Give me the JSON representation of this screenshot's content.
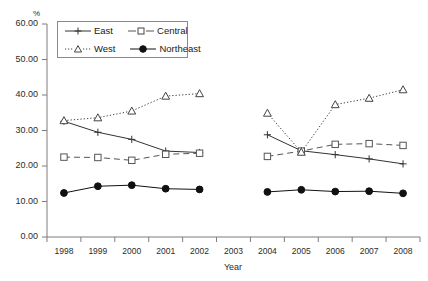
{
  "chart_data": {
    "type": "line",
    "title": "",
    "subtitle": "",
    "xlabel": "Year",
    "ylabel": "%",
    "ylim": [
      0,
      60
    ],
    "ytick_interval": 10,
    "ytick_labels": [
      "0.00",
      "10.00",
      "20.00",
      "30.00",
      "40.00",
      "50.00",
      "60.00"
    ],
    "ytick_values": [
      0,
      10,
      20,
      30,
      40,
      50,
      60
    ],
    "categories": [
      "1998",
      "1999",
      "2000",
      "2001",
      "2002",
      "2003",
      "2004",
      "2005",
      "2006",
      "2007",
      "2008"
    ],
    "x": [
      1998,
      1999,
      2000,
      2001,
      2002,
      2003,
      2004,
      2005,
      2006,
      2007,
      2008
    ],
    "gap_category": "2003",
    "grid": false,
    "legend_position": "upper-left-inside",
    "series": [
      {
        "name": "East",
        "marker": "plus",
        "line_style": "solid",
        "color": "#333333",
        "values": [
          32.6,
          29.5,
          27.5,
          24.2,
          23.8,
          null,
          28.8,
          24.3,
          23.2,
          22.0,
          20.6
        ]
      },
      {
        "name": "Central",
        "marker": "open-square",
        "line_style": "dashed",
        "color": "#555555",
        "values": [
          22.5,
          22.4,
          21.6,
          23.3,
          23.6,
          null,
          22.7,
          24.2,
          26.1,
          26.3,
          25.8
        ]
      },
      {
        "name": "West",
        "marker": "open-triangle",
        "line_style": "dotted",
        "color": "#444444",
        "values": [
          32.8,
          33.6,
          35.5,
          39.7,
          40.4,
          null,
          34.9,
          23.9,
          37.3,
          39.1,
          41.5
        ]
      },
      {
        "name": "Northeast",
        "marker": "filled-circle",
        "line_style": "solid",
        "color": "#111111",
        "values": [
          12.4,
          14.3,
          14.6,
          13.6,
          13.4,
          null,
          12.7,
          13.3,
          12.8,
          12.9,
          12.3
        ]
      }
    ]
  },
  "legend": {
    "entries": [
      {
        "label": "East"
      },
      {
        "label": "Central"
      },
      {
        "label": "West"
      },
      {
        "label": "Northeast"
      }
    ]
  },
  "axes": {
    "y_unit": "%",
    "x_title": "Year"
  }
}
